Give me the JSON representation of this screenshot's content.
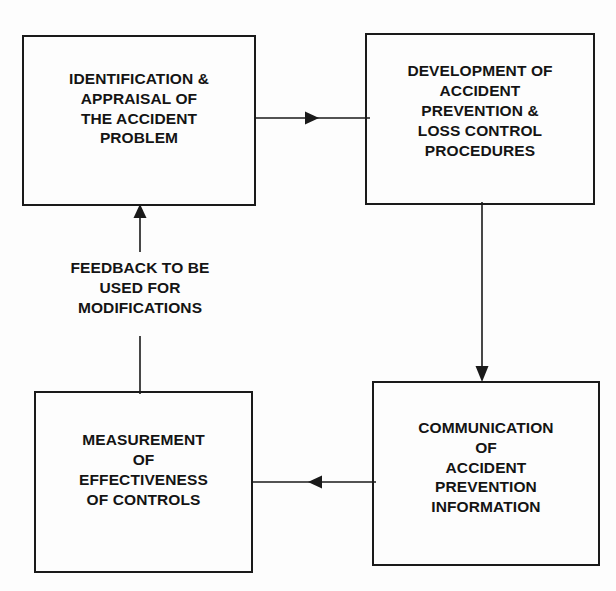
{
  "diagram": {
    "background_color": "#fdfdfd",
    "line_color": "#1a1a1a",
    "text_color": "#141414",
    "nodes": [
      {
        "id": "identification",
        "label": "IDENTIFICATION &\nAPPRAISAL OF\nTHE ACCIDENT\nPROBLEM",
        "position": "top-left"
      },
      {
        "id": "development",
        "label": "DEVELOPMENT OF\nACCIDENT\nPREVENTION &\nLOSS CONTROL\nPROCEDURES",
        "position": "top-right"
      },
      {
        "id": "communication",
        "label": "COMMUNICATION\nOF\nACCIDENT\nPREVENTION\nINFORMATION",
        "position": "bottom-right"
      },
      {
        "id": "measurement",
        "label": "MEASUREMENT\nOF\nEFFECTIVENESS\nOF CONTROLS",
        "position": "bottom-left"
      }
    ],
    "captions": [
      {
        "id": "feedback",
        "text": "FEEDBACK TO BE\nUSED FOR\nMODIFICATIONS"
      }
    ],
    "connectors": [
      {
        "id": "identification-to-development",
        "from": "identification",
        "to": "development",
        "direction": "right",
        "arrowhead": true
      },
      {
        "id": "development-to-communication",
        "from": "development",
        "to": "communication",
        "direction": "down",
        "arrowhead": true
      },
      {
        "id": "communication-to-measurement",
        "from": "communication",
        "to": "measurement",
        "direction": "left",
        "arrowhead": true
      },
      {
        "id": "measurement-to-identification",
        "from": "measurement",
        "to": "identification",
        "direction": "up",
        "arrowhead": true,
        "label": "FEEDBACK TO BE USED FOR MODIFICATIONS"
      }
    ]
  }
}
